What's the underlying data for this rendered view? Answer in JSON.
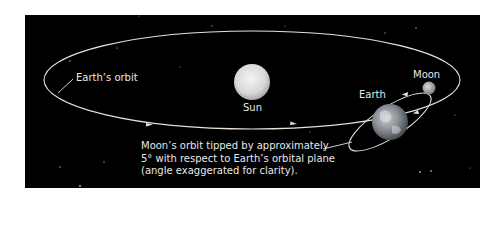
{
  "labels": {
    "earth_orbit": "Earth’s orbit",
    "sun": "Sun",
    "earth": "Earth",
    "moon": "Moon"
  },
  "caption": {
    "line1": "Moon’s orbit tipped by approximately",
    "line2": "5° with respect to Earth’s orbital plane",
    "line3": "(angle exaggerated for clarity)."
  },
  "colors": {
    "background": "#000000",
    "orbit_line": "#e6e2d6",
    "text": "#e8e8e8",
    "sun": "#e0e0e0"
  }
}
